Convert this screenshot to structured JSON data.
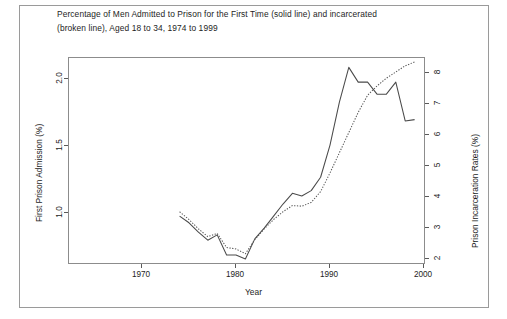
{
  "figure": {
    "title_line1": "Percentage of Men Admitted to Prison for the First Time (solid line) and incarcerated",
    "title_line2": "(broken line), Aged 18 to 34, 1974 to 1999"
  },
  "chart_data": {
    "type": "line",
    "title": "Percentage of Men Admitted to Prison for the First Time (solid line) and incarcerated (broken line), Aged 18 to 34, 1974 to 1999",
    "xlabel": "Year",
    "ylabel": "First Prison Admission (%)",
    "y2label": "Prison Incarceration Rates (%)",
    "xlim": [
      1974,
      1999
    ],
    "ylim": [
      0.62,
      2.15
    ],
    "y2lim": [
      1.85,
      8.45
    ],
    "xticks": [
      1970,
      1980,
      1990,
      2000
    ],
    "yticks": [
      1.0,
      1.5,
      2.0
    ],
    "y2ticks": [
      2,
      3,
      4,
      5,
      6,
      7,
      8
    ],
    "grid": false,
    "legend": "none (described in title)",
    "x": [
      1974,
      1975,
      1976,
      1977,
      1978,
      1979,
      1980,
      1981,
      1982,
      1983,
      1984,
      1985,
      1986,
      1987,
      1988,
      1989,
      1990,
      1991,
      1992,
      1993,
      1994,
      1995,
      1996,
      1997,
      1998,
      1999
    ],
    "series": [
      {
        "name": "First Prison Admission (%)",
        "style": "solid",
        "axis": "left",
        "units": "%",
        "values": [
          0.97,
          0.92,
          0.85,
          0.79,
          0.83,
          0.68,
          0.68,
          0.65,
          0.8,
          0.88,
          0.97,
          1.06,
          1.14,
          1.12,
          1.16,
          1.26,
          1.5,
          1.82,
          2.08,
          1.97,
          1.97,
          1.88,
          1.88,
          1.97,
          1.68,
          1.69
        ]
      },
      {
        "name": "Prison Incarceration Rates (%)",
        "style": "dotted",
        "axis": "right",
        "units": "%",
        "values": [
          3.5,
          3.25,
          2.95,
          2.7,
          2.8,
          2.35,
          2.3,
          2.15,
          2.6,
          2.95,
          3.25,
          3.5,
          3.7,
          3.68,
          3.8,
          4.15,
          4.75,
          5.4,
          6.05,
          6.7,
          7.25,
          7.55,
          7.8,
          8.0,
          8.2,
          8.32
        ]
      }
    ]
  },
  "axes": {
    "x_label": "Year",
    "y_left_label": "First Prison Admission (%)",
    "y_right_label": "Prison Incarceration Rates (%)",
    "x_tick_labels": [
      "1970",
      "1980",
      "1990",
      "2000"
    ],
    "y_left_tick_labels": [
      "1.0",
      "1.5",
      "2.0"
    ],
    "y_right_tick_labels": [
      "2",
      "3",
      "4",
      "5",
      "6",
      "7",
      "8"
    ]
  }
}
